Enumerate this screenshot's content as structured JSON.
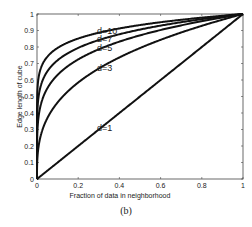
{
  "chart_data": {
    "type": "line",
    "title": "",
    "xlabel": "Fraction of data in neighborhood",
    "ylabel": "Edge length of cube",
    "xlim": [
      0,
      1
    ],
    "ylim": [
      0,
      1
    ],
    "grid": false,
    "legend": "inline labels",
    "xticks": [
      "0",
      "0.2",
      "0.4",
      "0.6",
      "0.8",
      "1"
    ],
    "yticks": [
      "0",
      "0.1",
      "0.2",
      "0.3",
      "0.4",
      "0.5",
      "0.6",
      "0.7",
      "0.8",
      "0.9",
      "1"
    ],
    "formula": "edge = fraction^(1/d)",
    "x": [
      0,
      0.001,
      0.01,
      0.05,
      0.1,
      0.2,
      0.3,
      0.4,
      0.5,
      0.6,
      0.7,
      0.8,
      0.9,
      1.0
    ],
    "series": [
      {
        "name": "d=10",
        "d": 10,
        "label": "d=10",
        "values": [
          0,
          0.501,
          0.631,
          0.741,
          0.794,
          0.851,
          0.887,
          0.912,
          0.933,
          0.95,
          0.965,
          0.978,
          0.99,
          1.0
        ]
      },
      {
        "name": "d=7",
        "d": 7,
        "label": "d=7",
        "values": [
          0,
          0.373,
          0.518,
          0.652,
          0.72,
          0.795,
          0.842,
          0.877,
          0.906,
          0.93,
          0.95,
          0.969,
          0.985,
          1.0
        ]
      },
      {
        "name": "d=5",
        "d": 5,
        "label": "d=5",
        "values": [
          0,
          0.251,
          0.398,
          0.549,
          0.631,
          0.725,
          0.786,
          0.833,
          0.871,
          0.903,
          0.931,
          0.956,
          0.979,
          1.0
        ]
      },
      {
        "name": "d=3",
        "d": 3,
        "label": "d=3",
        "values": [
          0,
          0.1,
          0.215,
          0.368,
          0.464,
          0.585,
          0.669,
          0.737,
          0.794,
          0.843,
          0.888,
          0.928,
          0.965,
          1.0
        ]
      },
      {
        "name": "d=1",
        "d": 1,
        "label": "d=1",
        "values": [
          0,
          0.001,
          0.01,
          0.05,
          0.1,
          0.2,
          0.3,
          0.4,
          0.5,
          0.6,
          0.7,
          0.8,
          0.9,
          1.0
        ]
      }
    ]
  },
  "caption": "(b)"
}
